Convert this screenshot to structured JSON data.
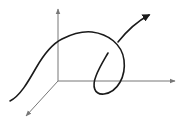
{
  "diagram": {
    "type": "3d-space-curve",
    "colors": {
      "background": "#ffffff",
      "axis": "#777777",
      "curve": "#1a1a1a"
    },
    "axes": {
      "origin": [
        58,
        81
      ],
      "vertical": {
        "from": [
          58,
          81
        ],
        "to": [
          58,
          8
        ]
      },
      "horizontal": {
        "from": [
          58,
          81
        ],
        "to": [
          176,
          81
        ]
      },
      "depth": {
        "from": [
          58,
          81
        ],
        "to": [
          25,
          117
        ]
      }
    },
    "curve": {
      "start": [
        10,
        101
      ],
      "end_arrow_tip": [
        152,
        13
      ],
      "has_loop": true,
      "segments": [
        "M10,101 C20,96 28,82 36,68 C44,54 52,44 62,39 C72,34 82,31 92,32 C108,34 122,44 124,60 C126,76 118,92 104,94 C94,95 92,86 96,76 C99,68 104,60 108,53",
        "M118,42 C126,32 136,22 149,15"
      ]
    }
  }
}
